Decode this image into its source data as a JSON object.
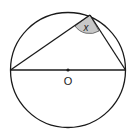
{
  "diagram": {
    "type": "circle-geometry",
    "center_label": "O",
    "angle_label": "x",
    "colors": {
      "stroke": "#1a1a1a",
      "angle_fill": "#c8c8c8",
      "background": "#ffffff"
    }
  }
}
